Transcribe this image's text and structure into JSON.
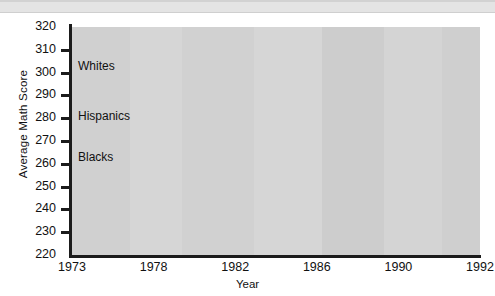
{
  "chart_data": {
    "type": "line",
    "title": "",
    "xlabel": "Year",
    "ylabel": "Average Math Score",
    "categories": [
      "1973",
      "1978",
      "1982",
      "1986",
      "1990",
      "1992"
    ],
    "ylim": [
      220,
      320
    ],
    "yticks": [
      220,
      230,
      240,
      250,
      260,
      270,
      280,
      290,
      300,
      310,
      320
    ],
    "grid": false,
    "legend_position": "inline-annotations",
    "series": [
      {
        "name": "Whites",
        "values": [
          310,
          306,
          304,
          308,
          310,
          312
        ],
        "color": "#6e6e6e"
      },
      {
        "name": "Hispanics",
        "values": [
          277,
          276,
          277,
          283,
          287,
          292
        ],
        "color": "#6e6e6e"
      },
      {
        "name": "Blacks",
        "values": [
          270,
          268,
          272,
          279,
          289,
          286
        ],
        "color": "#9a9a9a"
      }
    ],
    "annotations": [
      {
        "text": "Whites",
        "x": "1973",
        "y": 303
      },
      {
        "text": "Hispanics",
        "x": "1973",
        "y": 281
      },
      {
        "text": "Blacks",
        "x": "1973",
        "y": 263
      }
    ],
    "colors": {
      "plot_background": "#d3d3d3",
      "axis": "#1b1b1b",
      "text": "#111111",
      "whites_line": "#6e6e6e",
      "hispanics_line": "#6e6e6e",
      "blacks_line": "#9a9a9a"
    }
  }
}
